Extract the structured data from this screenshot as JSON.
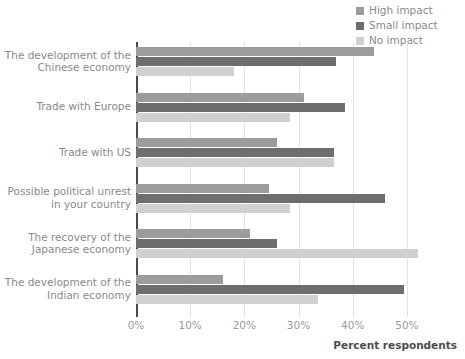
{
  "chart_data": {
    "type": "bar",
    "orientation": "horizontal",
    "title": "",
    "xlabel": "Percent respondents",
    "ylabel": "",
    "xlim": [
      0,
      55
    ],
    "xticks": [
      0,
      10,
      20,
      30,
      40,
      50
    ],
    "xtick_labels": [
      "0%",
      "10%",
      "20%",
      "30%",
      "40%",
      "50%"
    ],
    "grid": true,
    "legend_position": "top-right",
    "categories": [
      "The development of the\nChinese economy",
      "Trade with Europe",
      "Trade with US",
      "Possible political unrest\nin your country",
      "The recovery of the\nJapanese economy",
      "The development of the\nIndian economy"
    ],
    "category_lines": [
      [
        "The development of the",
        "Chinese economy"
      ],
      [
        "Trade with Europe"
      ],
      [
        "Trade with US"
      ],
      [
        "Possible political unrest",
        "in your country"
      ],
      [
        "The recovery of the",
        "Japanese economy"
      ],
      [
        "The development of the",
        "Indian economy"
      ]
    ],
    "series": [
      {
        "name": "High impact",
        "color": "#9c9c9c",
        "values": [
          44.0,
          31.0,
          26.0,
          24.5,
          21.0,
          16.0
        ]
      },
      {
        "name": "Small impact",
        "color": "#6e6e6e",
        "values": [
          37.0,
          38.5,
          36.5,
          46.0,
          26.0,
          49.5
        ]
      },
      {
        "name": "No impact",
        "color": "#d0d0d0",
        "values": [
          18.0,
          28.5,
          36.5,
          28.5,
          52.0,
          33.5
        ]
      }
    ]
  },
  "legend": {
    "items": [
      {
        "label": "High impact",
        "color": "#9c9c9c"
      },
      {
        "label": "Small impact",
        "color": "#6e6e6e"
      },
      {
        "label": "No impact",
        "color": "#d0d0d0"
      }
    ]
  },
  "axis": {
    "x_title": "Percent respondents"
  },
  "colors": {
    "axis_line": "#4a4a4a",
    "gridline": "#e2e2e2",
    "tick_text": "#9a9a9a",
    "category_text": "#8a8a8a",
    "axis_title_text": "#4d4d4d",
    "background": "#ffffff"
  }
}
